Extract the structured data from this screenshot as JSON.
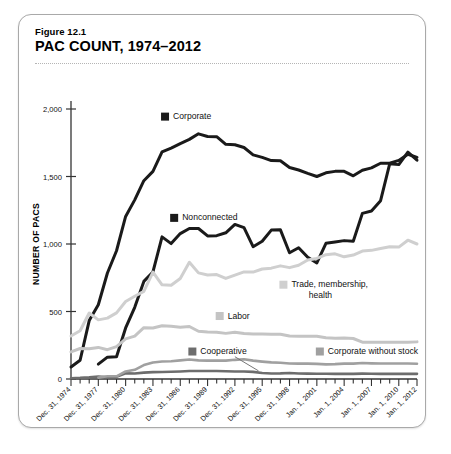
{
  "figure": {
    "number": "Figure 12.1",
    "title": "PAC COUNT, 1974–2012"
  },
  "chart_data": {
    "type": "line",
    "title": "PAC COUNT, 1974–2012",
    "xlabel": "",
    "ylabel": "NUMBER OF PACS",
    "ylim": [
      0,
      2000
    ],
    "yticks": [
      0,
      500,
      1000,
      1500,
      2000
    ],
    "ytick_labels": [
      "0",
      "500",
      "1,000",
      "1,500",
      "2,000"
    ],
    "grid": false,
    "legend_position": "inline-annotations",
    "x": [
      1974,
      1975,
      1976,
      1977,
      1978,
      1979,
      1980,
      1981,
      1982,
      1983,
      1984,
      1985,
      1986,
      1987,
      1988,
      1989,
      1990,
      1991,
      1992,
      1993,
      1994,
      1995,
      1996,
      1997,
      1998,
      1999,
      2000,
      2001,
      2002,
      2003,
      2004,
      2005,
      2006,
      2007,
      2008,
      2009,
      2010,
      2011,
      2012
    ],
    "xtick_labels": [
      "Dec. 31, 1974",
      "Dec. 31, 1977",
      "Dec. 31, 1980",
      "Dec. 31, 1983",
      "Dec. 31, 1986",
      "Dec. 31, 1989",
      "Dec. 31, 1992",
      "Dec. 31, 1995",
      "Dec. 31, 1998",
      "Jan. 1, 2001",
      "Jan. 1, 2004",
      "Jan. 1, 2007",
      "Jan. 1, 2010",
      "Jan. 1, 2012"
    ],
    "xtick_years": [
      1974,
      1977,
      1980,
      1983,
      1986,
      1989,
      1992,
      1995,
      1998,
      2001,
      2004,
      2007,
      2010,
      2012
    ],
    "series": [
      {
        "name": "Corporate",
        "color": "#1a1a1a",
        "width": 3.0,
        "label_x": 1984,
        "label_y": 1925,
        "values": [
          89,
          139,
          433,
          550,
          785,
          950,
          1204,
          1327,
          1469,
          1538,
          1682,
          1710,
          1744,
          1775,
          1816,
          1796,
          1795,
          1738,
          1735,
          1715,
          1660,
          1642,
          1618,
          1617,
          1567,
          1548,
          1523,
          1500,
          1527,
          1538,
          1538,
          1505,
          1546,
          1564,
          1598,
          1598,
          1619,
          1665,
          1642
        ]
      },
      {
        "name": "Nonconnected",
        "color": "#1a1a1a",
        "width": 3.0,
        "label_x": 1985,
        "label_y": 1175,
        "values": [
          0,
          0,
          0,
          110,
          162,
          165,
          378,
          531,
          723,
          793,
          1053,
          1003,
          1077,
          1115,
          1115,
          1060,
          1062,
          1083,
          1145,
          1121,
          980,
          1020,
          1103,
          1105,
          935,
          972,
          902,
          860,
          1005,
          1015,
          1025,
          1020,
          1227,
          1244,
          1321,
          1594,
          1588,
          1680,
          1621
        ]
      },
      {
        "name": "Trade, membership, health",
        "color": "#cfcfcf",
        "width": 3.0,
        "label_x": 1997,
        "label_y": 680,
        "label_line2": "health",
        "values": [
          318,
          357,
          489,
          438,
          451,
          490,
          574,
          613,
          649,
          792,
          698,
          695,
          745,
          865,
          786,
          770,
          774,
          745,
          770,
          793,
          792,
          815,
          821,
          838,
          825,
          843,
          881,
          893,
          921,
          927,
          905,
          918,
          948,
          953,
          967,
          979,
          977,
          1028,
          1000
        ]
      },
      {
        "name": "Labor",
        "color": "#c4c4c4",
        "width": 3.0,
        "label_x": 1990,
        "label_y": 448,
        "values": [
          201,
          226,
          224,
          234,
          217,
          240,
          297,
          318,
          380,
          378,
          394,
          390,
          384,
          389,
          354,
          349,
          346,
          338,
          347,
          337,
          333,
          334,
          332,
          332,
          318,
          317,
          316,
          317,
          306,
          302,
          303,
          300,
          273,
          273,
          272,
          272,
          272,
          273,
          275
        ]
      },
      {
        "name": "Cooperative",
        "color": "#6d6d6d",
        "width": 2.6,
        "label_x": 1987,
        "label_y": 185,
        "values": [
          6,
          8,
          12,
          18,
          12,
          17,
          42,
          41,
          47,
          51,
          52,
          54,
          56,
          59,
          59,
          59,
          59,
          57,
          56,
          56,
          53,
          44,
          41,
          42,
          45,
          41,
          40,
          39,
          39,
          38,
          38,
          38,
          40,
          39,
          38,
          38,
          38,
          38,
          38
        ]
      },
      {
        "name": "Corporate without stock",
        "color": "#a0a0a0",
        "width": 2.6,
        "label_x": 2001,
        "label_y": 185,
        "values": [
          0,
          0,
          0,
          10,
          20,
          20,
          56,
          68,
          103,
          122,
          130,
          132,
          138,
          145,
          138,
          136,
          136,
          136,
          142,
          146,
          136,
          129,
          123,
          120,
          115,
          114,
          114,
          112,
          108,
          110,
          114,
          114,
          118,
          116,
          115,
          115,
          115,
          115,
          113
        ]
      }
    ]
  }
}
